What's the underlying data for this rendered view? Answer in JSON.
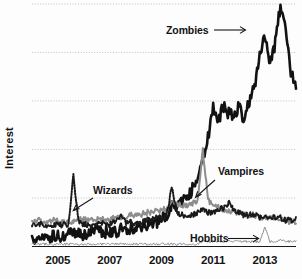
{
  "chart_data": {
    "type": "line",
    "title": "",
    "xlabel": "",
    "ylabel": "Interest",
    "xlim": [
      2004.0,
      2014.2
    ],
    "ylim": [
      0,
      100
    ],
    "grid": true,
    "gridlines_y": [
      20,
      40,
      60,
      80,
      100
    ],
    "legend": "inline-annotations",
    "xticks": [
      "2005",
      "2007",
      "2009",
      "2011",
      "2013"
    ],
    "xtick_values": [
      2005,
      2007,
      2009,
      2011,
      2013
    ],
    "annotations": [
      {
        "label": "Zombies",
        "series": "Zombies"
      },
      {
        "label": "Vampires",
        "series": "Vampires"
      },
      {
        "label": "Wizards",
        "series": "Wizards"
      },
      {
        "label": "Hobbits",
        "series": "Hobbits"
      }
    ],
    "x": [
      2004.0,
      2004.2,
      2004.4,
      2004.6,
      2004.8,
      2005.0,
      2005.2,
      2005.4,
      2005.6,
      2005.8,
      2006.0,
      2006.2,
      2006.4,
      2006.6,
      2006.8,
      2007.0,
      2007.2,
      2007.4,
      2007.6,
      2007.8,
      2008.0,
      2008.2,
      2008.4,
      2008.6,
      2008.8,
      2009.0,
      2009.2,
      2009.4,
      2009.6,
      2009.8,
      2010.0,
      2010.2,
      2010.4,
      2010.6,
      2010.8,
      2011.0,
      2011.2,
      2011.4,
      2011.6,
      2011.8,
      2012.0,
      2012.2,
      2012.4,
      2012.6,
      2012.8,
      2013.0,
      2013.2,
      2013.4,
      2013.6,
      2013.8,
      2014.0,
      2014.2
    ],
    "series": [
      {
        "name": "Zombies",
        "style": "solid-black",
        "color": "#121212",
        "values": [
          3,
          3,
          4,
          4,
          4,
          4,
          4,
          5,
          5,
          5,
          5,
          5,
          6,
          6,
          6,
          6,
          6,
          7,
          7,
          7,
          8,
          8,
          9,
          9,
          10,
          11,
          13,
          17,
          16,
          18,
          20,
          24,
          29,
          36,
          45,
          57,
          52,
          58,
          55,
          54,
          58,
          52,
          60,
          66,
          78,
          88,
          76,
          84,
          100,
          88,
          72,
          66
        ]
      },
      {
        "name": "Vampires",
        "style": "solid-gray",
        "color": "#8d8d8d",
        "values": [
          10,
          11,
          10,
          10,
          11,
          11,
          10,
          10,
          10,
          11,
          11,
          11,
          11,
          12,
          11,
          11,
          12,
          12,
          12,
          13,
          13,
          13,
          14,
          14,
          15,
          15,
          16,
          18,
          17,
          17,
          17,
          18,
          19,
          40,
          19,
          17,
          16,
          15,
          15,
          14,
          14,
          13,
          13,
          13,
          12,
          12,
          12,
          11,
          11,
          11,
          10,
          10
        ]
      },
      {
        "name": "Wizards",
        "style": "dotted-black",
        "color": "#1a1a1a",
        "values": [
          9,
          9,
          9,
          9,
          9,
          9,
          9,
          9,
          29,
          10,
          9,
          9,
          9,
          10,
          9,
          9,
          10,
          13,
          10,
          10,
          10,
          10,
          11,
          11,
          12,
          12,
          13,
          24,
          14,
          13,
          13,
          13,
          14,
          15,
          14,
          14,
          15,
          16,
          18,
          15,
          14,
          13,
          13,
          13,
          12,
          13,
          12,
          12,
          12,
          11,
          11,
          11
        ]
      },
      {
        "name": "Hobbits",
        "style": "solid-lightgray",
        "color": "#8f8f8f",
        "values": [
          1,
          1,
          1,
          1,
          1,
          1,
          1,
          1,
          1,
          1,
          1,
          1,
          1,
          1,
          1,
          1,
          1,
          1,
          1,
          1,
          1,
          1,
          1,
          1,
          1,
          1,
          1,
          1,
          1,
          1,
          1,
          1,
          1,
          2,
          2,
          2,
          2,
          2,
          2,
          2,
          2,
          2,
          2,
          2,
          2,
          8,
          2,
          2,
          3,
          2,
          2,
          2
        ]
      }
    ]
  },
  "axis": {
    "y_label": "Interest"
  },
  "labels": {
    "zombies": "Zombies",
    "vampires": "Vampires",
    "wizards": "Wizards",
    "hobbits": "Hobbits"
  },
  "ticks": {
    "t0": "2005",
    "t1": "2007",
    "t2": "2009",
    "t3": "2011",
    "t4": "2013"
  },
  "colors": {
    "zombies": "#121212",
    "vampires": "#8d8d8d",
    "wizards": "#1a1a1a",
    "hobbits": "#8f8f8f",
    "grid": "#b9b9b9",
    "axis": "#1b1b1b",
    "background": "#fdfdfd"
  }
}
